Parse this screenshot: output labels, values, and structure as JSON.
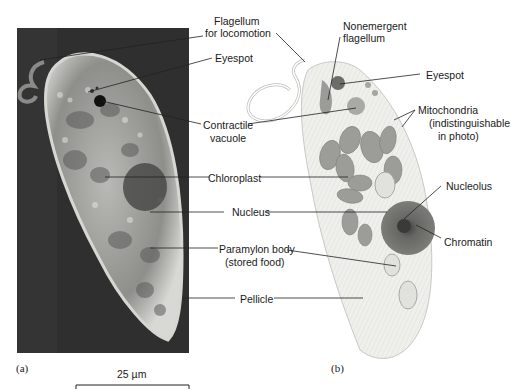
{
  "figure": {
    "panel_a": {
      "tag": "(a)",
      "type": "light micrograph",
      "scale_bar": "25 µm"
    },
    "panel_b": {
      "tag": "(b)",
      "type": "drawing"
    },
    "labels_a": {
      "flagellum_1": "Flagellum",
      "flagellum_2": "for locomotion",
      "eyespot": "Eyespot",
      "contractile_1": "Contractile",
      "contractile_2": "vacuole",
      "chloroplast": "Chloroplast",
      "nucleus": "Nucleus",
      "paramylon_1": "Paramylon body",
      "paramylon_2": "(stored food)",
      "pellicle": "Pellicle"
    },
    "labels_b": {
      "nonemergent_1": "Nonemergent",
      "nonemergent_2": "flagellum",
      "eyespot": "Eyespot",
      "mito_1": "Mitochondria",
      "mito_2": "(indistinguishable",
      "mito_3": "in photo)",
      "nucleolus": "Nucleolus",
      "chromatin": "Chromatin"
    },
    "colors": {
      "background": "#ffffff",
      "photo_bg": "#2e2e2e",
      "cell_fill": "#efefec",
      "organelle": "#9a9a98",
      "nucleus": "#6a6a68",
      "leader_line": "#222222"
    }
  }
}
